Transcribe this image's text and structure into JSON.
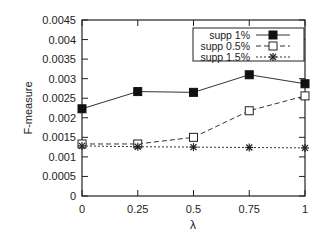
{
  "chart_data": {
    "type": "line",
    "title": "",
    "xlabel": "λ",
    "ylabel": "F-measure",
    "x": [
      0,
      0.25,
      0.5,
      0.75,
      1
    ],
    "x_tick_labels": [
      "0",
      "0.25",
      "0.5",
      "0.75",
      "1"
    ],
    "y_tick_labels": [
      "0",
      "0.0005",
      "0.001",
      "0.0015",
      "0.002",
      "0.0025",
      "0.003",
      "0.0035",
      "0.004",
      "0.0045"
    ],
    "xlim": [
      0,
      1
    ],
    "ylim": [
      0,
      0.0045
    ],
    "grid": false,
    "legend_position": "top-right",
    "series": [
      {
        "name": "supp 1%",
        "marker": "filled-square",
        "line": "solid",
        "values": [
          0.00223,
          0.00267,
          0.00265,
          0.0031,
          0.00287
        ]
      },
      {
        "name": "supp 0.5%",
        "marker": "open-square",
        "line": "dashed",
        "values": [
          0.00133,
          0.00133,
          0.0015,
          0.00218,
          0.00256
        ]
      },
      {
        "name": "supp 1.5%",
        "marker": "asterisk",
        "line": "dotted",
        "values": [
          0.00128,
          0.00126,
          0.00125,
          0.00124,
          0.00123
        ]
      }
    ]
  }
}
